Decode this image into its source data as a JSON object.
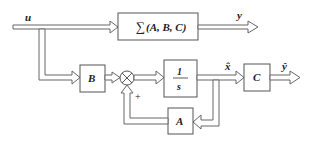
{
  "diagram": {
    "signals": {
      "input": "u",
      "output": "y",
      "estimated_state": "x̂",
      "estimated_output": "ŷ"
    },
    "blocks": {
      "plant": {
        "label": "∑(A, B, C)",
        "sigma": "∑",
        "args": "(A, B, C)"
      },
      "B": {
        "label": "B"
      },
      "integrator": {
        "numerator": "1",
        "denominator": "s"
      },
      "C": {
        "label": "C"
      },
      "A": {
        "label": "A"
      }
    },
    "summing_junction": {
      "symbol": "×",
      "sign": "+"
    },
    "colors": {
      "line": "#666666",
      "text": "#222222",
      "background": "#ffffff"
    }
  }
}
